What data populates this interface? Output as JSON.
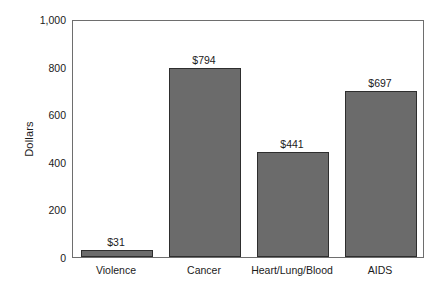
{
  "chart_data": {
    "type": "bar",
    "title": "",
    "subtitle": "",
    "xlabel": "",
    "ylabel": "Dollars",
    "categories": [
      "Violence",
      "Cancer",
      "Heart/Lung/Blood",
      "AIDS"
    ],
    "values": [
      31,
      794,
      441,
      697
    ],
    "data_labels": [
      "$31",
      "$794",
      "$441",
      "$697"
    ],
    "ylim": [
      0,
      1000
    ],
    "ytick_values": [
      0,
      200,
      400,
      600,
      800,
      1000
    ],
    "ytick_labels": [
      "0",
      "200",
      "400",
      "600",
      "800",
      "1,000"
    ],
    "grid": false,
    "legend": false,
    "legend_position": "none",
    "bar_color": "#6b6b6b",
    "bar_border_color": "#2e2e2e",
    "frame_color": "#6e6e6e",
    "background_color": "#ffffff"
  }
}
